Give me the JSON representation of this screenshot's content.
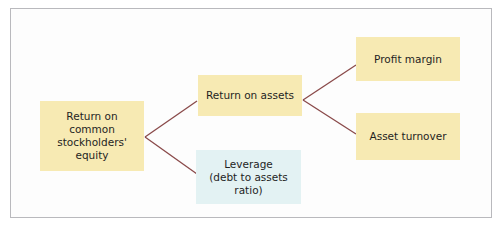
{
  "diagram": {
    "type": "tree",
    "colors": {
      "box_yellow": "#f7eab3",
      "box_blue": "#e3f2f3",
      "connector": "#8a4a4a",
      "frame_border": "#b9b9bd"
    },
    "nodes": {
      "roe": {
        "label": "Return on common stockholders' equity",
        "lines": [
          "Return on",
          "common",
          "stockholders'",
          "equity"
        ]
      },
      "roa": {
        "label": "Return on assets"
      },
      "leverage": {
        "label": "Leverage (debt to assets ratio)",
        "lines": [
          "Leverage",
          "(debt to assets ratio)"
        ]
      },
      "profit_margin": {
        "label": "Profit margin"
      },
      "asset_turnover": {
        "label": "Asset turnover"
      }
    },
    "edges": [
      {
        "from": "roe",
        "to": "roa"
      },
      {
        "from": "roe",
        "to": "leverage"
      },
      {
        "from": "roa",
        "to": "profit_margin"
      },
      {
        "from": "roa",
        "to": "asset_turnover"
      }
    ]
  }
}
